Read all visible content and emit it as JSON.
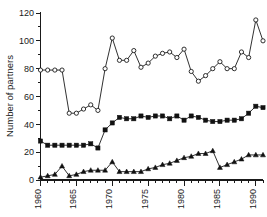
{
  "chart_data": {
    "type": "line",
    "title": "",
    "xlabel": "",
    "ylabel": "Number of partners",
    "xlim": [
      1960,
      1991
    ],
    "ylim": [
      0,
      120
    ],
    "yticks": [
      0,
      20,
      40,
      60,
      80,
      100,
      120
    ],
    "xticks": [
      1960,
      1965,
      1970,
      1975,
      1980,
      1985,
      1990
    ],
    "xtick_labels": [
      "1960",
      "1965",
      "1970",
      "1975",
      "1980",
      "1985",
      "1990"
    ],
    "ytick_labels": [
      "0",
      "20",
      "40",
      "60",
      "80",
      "100",
      "120"
    ],
    "xtick_minor_step": 1,
    "grid": false,
    "legend": "none",
    "x": [
      1960,
      1961,
      1962,
      1963,
      1964,
      1965,
      1966,
      1967,
      1968,
      1969,
      1970,
      1971,
      1972,
      1973,
      1974,
      1975,
      1976,
      1977,
      1978,
      1979,
      1980,
      1981,
      1982,
      1983,
      1984,
      1985,
      1986,
      1987,
      1988,
      1989,
      1990,
      1991
    ],
    "series": [
      {
        "name": "open-circle-series",
        "marker": "circle-open",
        "values": [
          79,
          79,
          79,
          79,
          48,
          48,
          51,
          54,
          50,
          80,
          102,
          86,
          86,
          93,
          81,
          84,
          89,
          91,
          92,
          88,
          94,
          78,
          71,
          75,
          80,
          85,
          80,
          80,
          92,
          88,
          115,
          100
        ]
      },
      {
        "name": "filled-square-series",
        "marker": "square-filled",
        "values": [
          28,
          25,
          25,
          25,
          25,
          25,
          25,
          26,
          23,
          36,
          41,
          45,
          44,
          44,
          46,
          45,
          46,
          46,
          44,
          46,
          43,
          46,
          45,
          43,
          42,
          42,
          43,
          43,
          44,
          48,
          53,
          52
        ]
      },
      {
        "name": "filled-triangle-series",
        "marker": "triangle-filled",
        "values": [
          2,
          3,
          4,
          10,
          3,
          4,
          6,
          7,
          7,
          7,
          13,
          6,
          6,
          6,
          6,
          8,
          9,
          11,
          12,
          14,
          16,
          17,
          19,
          19,
          21,
          9,
          11,
          13,
          15,
          18,
          18,
          18
        ]
      }
    ]
  }
}
